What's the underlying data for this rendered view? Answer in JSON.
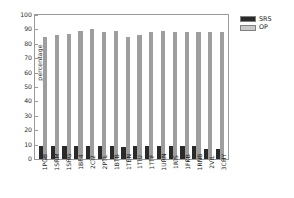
{
  "chart_data": {
    "type": "bar",
    "title": "",
    "xlabel": "",
    "ylabel": "percentage",
    "ylim": [
      0,
      100
    ],
    "ytick_step": 10,
    "yticks": [
      0,
      10,
      20,
      30,
      40,
      50,
      60,
      70,
      80,
      90,
      100
    ],
    "grid": false,
    "legend_position": "upper right outside",
    "categories": [
      "1PGB",
      "1SRM",
      "1SHG",
      "1BF4",
      "2CI2",
      "2PTL",
      "1BTB",
      "1TEN",
      "1TIU",
      "1TTF",
      "1URN",
      "1RIS",
      "1FKB",
      "1RNB",
      "2VIL",
      "3CHY"
    ],
    "series": [
      {
        "name": "SRS",
        "color": "#2a2a2a",
        "values": [
          9,
          9,
          9,
          9,
          9,
          9,
          9,
          8,
          9,
          9,
          9,
          9,
          9,
          9,
          7,
          7
        ]
      },
      {
        "name": "OP",
        "color": "#9e9e9e",
        "values": [
          85,
          86,
          87,
          89,
          90,
          88,
          89,
          85,
          86,
          88,
          89,
          88,
          88,
          88,
          88,
          88
        ]
      }
    ]
  },
  "legend": {
    "items": [
      {
        "label": "SRS",
        "swatch": "srs"
      },
      {
        "label": "OP",
        "swatch": "op"
      }
    ]
  },
  "axes": {
    "y_title": "percentage"
  }
}
